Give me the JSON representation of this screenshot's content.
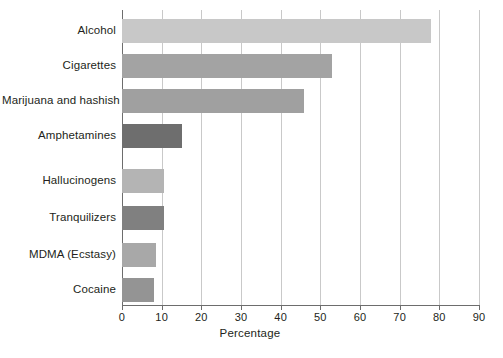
{
  "chart_data": {
    "type": "bar",
    "orientation": "horizontal",
    "title": "",
    "xlabel": "Percentage",
    "ylabel": "",
    "xlim": [
      0,
      90
    ],
    "xticks": [
      0,
      10,
      20,
      30,
      40,
      50,
      60,
      70,
      80,
      90
    ],
    "grid": true,
    "legend": false,
    "categories": [
      "Alcohol",
      "Cigarettes",
      "Marijuana and hashish",
      "Amphetamines",
      "Hallucinogens",
      "Tranquilizers",
      "MDMA (Ecstasy)",
      "Cocaine"
    ],
    "values": [
      78,
      53,
      46,
      15,
      10.5,
      10.5,
      8.5,
      8
    ],
    "bar_colors": [
      "#c8c8c8",
      "#a3a3a3",
      "#a0a0a0",
      "#6e6e6e",
      "#b4b4b4",
      "#808080",
      "#a8a8a8",
      "#949494"
    ]
  },
  "axis": {
    "tick_labels": [
      "0",
      "10",
      "20",
      "30",
      "40",
      "50",
      "60",
      "70",
      "80",
      "90"
    ],
    "x_title": "Percentage"
  },
  "colors": {
    "background": "#ffffff",
    "gridline": "#c9c9c9",
    "axis": "#6d6d6d",
    "text": "#231f20"
  }
}
